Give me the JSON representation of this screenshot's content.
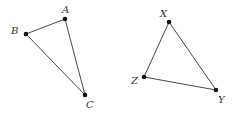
{
  "figures": [
    {
      "name": "triangle-abc",
      "vertices": [
        {
          "id": "A",
          "label": "A",
          "x": 65,
          "y": 19,
          "lx": 62,
          "ly": 12
        },
        {
          "id": "B",
          "label": "B",
          "x": 26,
          "y": 34,
          "lx": 12,
          "ly": 34
        },
        {
          "id": "C",
          "label": "C",
          "x": 85,
          "y": 95,
          "lx": 87,
          "ly": 108
        }
      ]
    },
    {
      "name": "triangle-xyz",
      "vertices": [
        {
          "id": "X",
          "label": "X",
          "x": 169,
          "y": 22,
          "lx": 160,
          "ly": 16
        },
        {
          "id": "Y",
          "label": "Y",
          "x": 216,
          "y": 90,
          "lx": 218,
          "ly": 104
        },
        {
          "id": "Z",
          "label": "Z",
          "x": 144,
          "y": 77,
          "lx": 131,
          "ly": 84
        }
      ]
    }
  ],
  "labels": {
    "A": "A",
    "B": "B",
    "C": "C",
    "X": "X",
    "Y": "Y",
    "Z": "Z"
  }
}
